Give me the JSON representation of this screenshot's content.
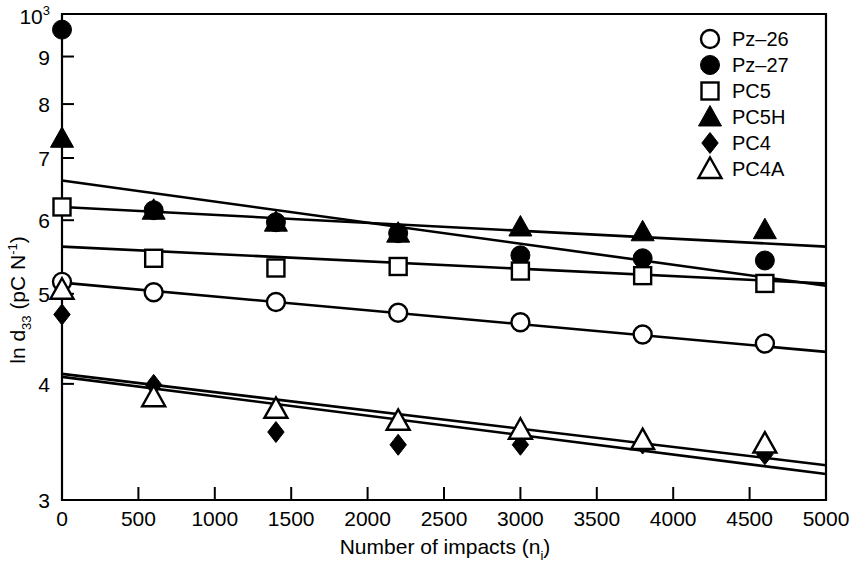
{
  "chart_data": {
    "type": "scatter",
    "title": "",
    "xlabel": "Number of impacts (n",
    "xlabel_sub": "i",
    "xlabel_tail": ")",
    "ylabel_prefix": "ln d",
    "ylabel_sub": "33",
    "ylabel_mid": " (pC N",
    "ylabel_sup": "-1",
    "ylabel_tail": ")",
    "xlim": [
      0,
      5000
    ],
    "ylim": [
      3,
      10
    ],
    "yscale": "log",
    "grid": false,
    "legend_position": "top-right",
    "xticks": [
      0,
      500,
      1000,
      1500,
      2000,
      2500,
      3000,
      3500,
      4000,
      4500,
      5000
    ],
    "xtick_labels": [
      "0",
      "500",
      "1000",
      "1500",
      "2000",
      "2500",
      "3000",
      "3500",
      "4000",
      "4500",
      "5000"
    ],
    "yticks": [
      3,
      4,
      5,
      6,
      7,
      8,
      9,
      10
    ],
    "ytick_labels": [
      "3",
      "4",
      "5",
      "6",
      "7",
      "8",
      "9",
      "10"
    ],
    "ytop_label_base": "10",
    "ytop_label_sup": "3",
    "series": [
      {
        "name": "Pz-26",
        "marker": "open-circle",
        "x": [
          0,
          600,
          1400,
          2200,
          3000,
          3800,
          4600
        ],
        "y": [
          5.15,
          5.02,
          4.9,
          4.77,
          4.66,
          4.52,
          4.42
        ],
        "fit": {
          "x0": 0,
          "y0": 5.14,
          "x1": 5000,
          "y1": 4.33
        }
      },
      {
        "name": "Pz-27",
        "marker": "filled-circle",
        "x": [
          0,
          600,
          1400,
          2200,
          3000,
          3800,
          4600
        ],
        "y": [
          9.62,
          6.15,
          5.97,
          5.81,
          5.5,
          5.46,
          5.43
        ],
        "fit": {
          "x0": 0,
          "y0": 6.62,
          "x1": 5000,
          "y1": 5.1
        }
      },
      {
        "name": "PC5",
        "marker": "open-square",
        "x": [
          0,
          600,
          1400,
          2200,
          3000,
          3800,
          4600
        ],
        "y": [
          6.2,
          5.46,
          5.33,
          5.35,
          5.29,
          5.23,
          5.13
        ],
        "fit": {
          "x0": 0,
          "y0": 5.62,
          "x1": 5000,
          "y1": 5.13
        }
      },
      {
        "name": "PC5H",
        "marker": "filled-triangle",
        "x": [
          0,
          600,
          1400,
          2200,
          3000,
          3800,
          4600
        ],
        "y": [
          7.35,
          6.15,
          5.97,
          5.81,
          5.9,
          5.83,
          5.86
        ],
        "fit": {
          "x0": 0,
          "y0": 6.2,
          "x1": 5000,
          "y1": 5.62
        }
      },
      {
        "name": "PC4",
        "marker": "filled-diamond",
        "x": [
          0,
          600,
          1400,
          2200,
          3000,
          3800,
          4600
        ],
        "y": [
          4.75,
          3.99,
          3.55,
          3.44,
          3.44,
          3.45,
          3.36
        ],
        "fit": {
          "x0": 0,
          "y0": 4.07,
          "x1": 5000,
          "y1": 3.2
        }
      },
      {
        "name": "PC4A",
        "marker": "open-triangle",
        "x": [
          0,
          600,
          1400,
          2200,
          3000,
          3800,
          4600
        ],
        "y": [
          5.05,
          3.87,
          3.76,
          3.65,
          3.57,
          3.48,
          3.45
        ],
        "fit": {
          "x0": 0,
          "y0": 4.1,
          "x1": 5000,
          "y1": 3.27
        }
      }
    ]
  },
  "legend": {
    "entries": [
      {
        "label": "Pz–26",
        "marker": "open-circle"
      },
      {
        "label": "Pz–27",
        "marker": "filled-circle"
      },
      {
        "label": "PC5",
        "marker": "open-square"
      },
      {
        "label": "PC5H",
        "marker": "filled-triangle"
      },
      {
        "label": "PC4",
        "marker": "filled-diamond"
      },
      {
        "label": "PC4A",
        "marker": "open-triangle"
      }
    ]
  }
}
